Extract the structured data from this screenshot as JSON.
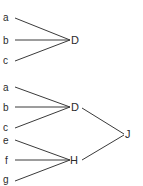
{
  "diagrams": [
    {
      "name": "tree-1",
      "leaves": [
        {
          "label": "a",
          "x": 8,
          "y": 17
        },
        {
          "label": "b",
          "x": 8,
          "y": 40
        },
        {
          "label": "c",
          "x": 8,
          "y": 61
        }
      ],
      "nodes": [
        {
          "label": "D",
          "x": 72,
          "y": 44
        }
      ]
    },
    {
      "name": "tree-2",
      "leaves": [
        {
          "label": "a",
          "x": 8,
          "y": 87
        },
        {
          "label": "b",
          "x": 8,
          "y": 108
        },
        {
          "label": "c",
          "x": 8,
          "y": 128
        },
        {
          "label": "e",
          "x": 8,
          "y": 141
        },
        {
          "label": "f",
          "x": 8,
          "y": 161
        },
        {
          "label": "g",
          "x": 8,
          "y": 181
        }
      ],
      "nodes": [
        {
          "label": "D",
          "x": 72,
          "y": 111
        },
        {
          "label": "H",
          "x": 71,
          "y": 164
        },
        {
          "label": "J",
          "x": 126,
          "y": 138
        }
      ]
    }
  ]
}
